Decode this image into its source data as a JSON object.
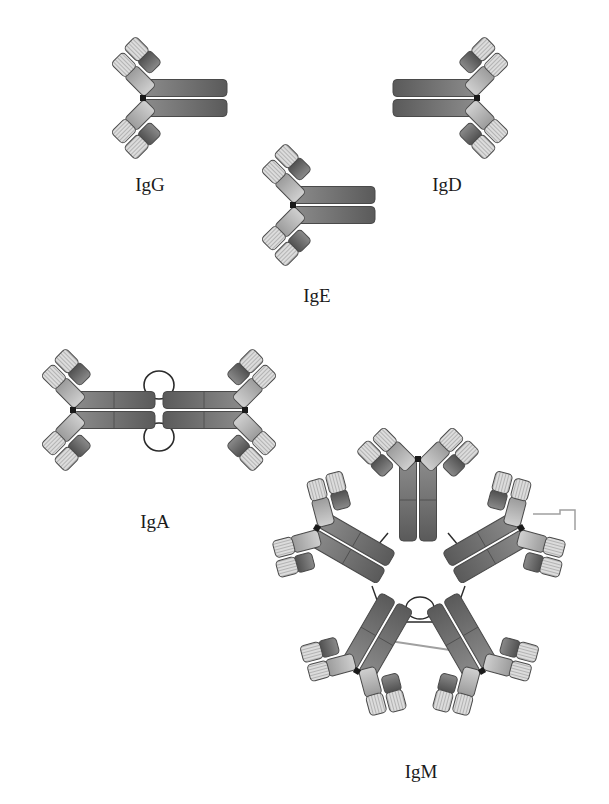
{
  "figure": {
    "title": "",
    "background": "#ffffff",
    "colors": {
      "heavy_dark": "#5e5e5e",
      "heavy_mid": "#8a8a8a",
      "hinge_light": "#b8b8b8",
      "variable_light": "#d6d6d6",
      "outline": "#4a4a4a",
      "disulfide": "#1a1a1a",
      "j_chain": "#2a2a2a",
      "secretory_link": "#a0a0a0"
    }
  },
  "labels": [
    {
      "id": "igg",
      "text": "IgG",
      "x": 150,
      "y": 185
    },
    {
      "id": "igd",
      "text": "IgD",
      "x": 447,
      "y": 185
    },
    {
      "id": "ige",
      "text": "IgE",
      "x": 317,
      "y": 296
    },
    {
      "id": "iga",
      "text": "IgA",
      "x": 155,
      "y": 522
    },
    {
      "id": "igm",
      "text": "IgM",
      "x": 421,
      "y": 772
    }
  ],
  "antibodies": [
    {
      "id": "igg",
      "name": "IgG",
      "class": "monomer",
      "units": [
        {
          "jx": 143,
          "jy": 98,
          "angle": 0,
          "stem": 84,
          "seg": 1
        }
      ]
    },
    {
      "id": "igd",
      "name": "IgD",
      "class": "monomer",
      "units": [
        {
          "jx": 477,
          "jy": 98,
          "angle": 180,
          "stem": 84,
          "seg": 1
        }
      ]
    },
    {
      "id": "ige",
      "name": "IgE",
      "class": "monomer",
      "units": [
        {
          "jx": 293,
          "jy": 205,
          "angle": 0,
          "stem": 82,
          "seg": 1
        }
      ]
    },
    {
      "id": "iga",
      "name": "IgA",
      "class": "dimer",
      "units": [
        {
          "jx": 73,
          "jy": 410,
          "angle": 0,
          "stem": 82,
          "seg": 2
        },
        {
          "jx": 245,
          "jy": 410,
          "angle": 180,
          "stem": 82,
          "seg": 2
        }
      ],
      "j_chain_loops": [
        {
          "cx": 159,
          "cy": 385,
          "rx": 15,
          "ry": 14
        },
        {
          "cx": 159,
          "cy": 437,
          "rx": 15,
          "ry": 14
        }
      ]
    },
    {
      "id": "igm",
      "name": "IgM",
      "class": "pentamer",
      "units": [
        {
          "jx": 418,
          "jy": 459,
          "angle": 90,
          "stem": 82,
          "seg": 2
        },
        {
          "jx": 521,
          "jy": 528,
          "angle": 150,
          "stem": 80,
          "seg": 2
        },
        {
          "jx": 482,
          "jy": 671,
          "angle": 240,
          "stem": 80,
          "seg": 2
        },
        {
          "jx": 357,
          "jy": 671,
          "angle": 300,
          "stem": 80,
          "seg": 2
        },
        {
          "jx": 317,
          "jy": 528,
          "angle": 30,
          "stem": 80,
          "seg": 2
        }
      ],
      "connectors": [
        [
          388,
          533,
          378,
          545
        ],
        [
          448,
          533,
          458,
          545
        ],
        [
          372,
          586,
          377,
          600
        ],
        [
          465,
          586,
          460,
          600
        ],
        [
          388,
          622,
          452,
          622
        ]
      ],
      "j_chain_loop": {
        "cx": 420,
        "cy": 608,
        "rx": 14,
        "ry": 11
      },
      "secretory_link": {
        "points": "533,514 560,514 560,510 575,510 575,530"
      },
      "grey_link": [
        383,
        640,
        450,
        650
      ]
    }
  ]
}
